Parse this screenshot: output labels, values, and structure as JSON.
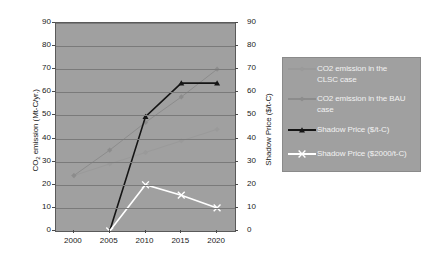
{
  "chart_data": {
    "type": "line",
    "title": "",
    "xlabel": "",
    "ylabel": "CO2 emission (Mt-C/yr.)",
    "ylabel_right": "Shadow Price ($/t-C)",
    "x": [
      2000,
      2005,
      2010,
      2015,
      2020
    ],
    "xticklabels": [
      "2000",
      "2005",
      "2010",
      "2015",
      "2020"
    ],
    "ylim": [
      0,
      90
    ],
    "yticks": [
      0,
      10,
      20,
      30,
      40,
      50,
      60,
      70,
      80,
      90
    ],
    "yticklabels": [
      "0",
      "10",
      "20",
      "30",
      "40",
      "50",
      "60",
      "70",
      "80",
      "90"
    ],
    "ylim_right": [
      0,
      90
    ],
    "yticks_right": [
      0,
      10,
      20,
      30,
      40,
      50,
      60,
      70,
      80,
      90
    ],
    "yticklabels_right": [
      "0",
      "10",
      "20",
      "30",
      "40",
      "50",
      "60",
      "70",
      "80",
      "90"
    ],
    "grid": true,
    "grid_axis": "y",
    "legend_position": "right-outside",
    "plot_background": "#a0a0a0",
    "series": [
      {
        "name": "CO2 emission in the CLSC case",
        "axis": "left",
        "color": "#9a9a9a",
        "marker": "diamond",
        "x": [
          2000,
          2005,
          2010,
          2015,
          2020
        ],
        "values": [
          24,
          29,
          34,
          39,
          44
        ]
      },
      {
        "name": "CO2 emission in the BAU case",
        "axis": "left",
        "color": "#8c8c8c",
        "marker": "diamond",
        "x": [
          2000,
          2005,
          2010,
          2015,
          2020
        ],
        "values": [
          24,
          35,
          47,
          58,
          70
        ]
      },
      {
        "name": "Shadow Price ($/t-C)",
        "axis": "right",
        "color": "#151515",
        "marker": "triangle",
        "x": [
          2005,
          2010,
          2015,
          2020
        ],
        "values": [
          0,
          49.5,
          64,
          64
        ]
      },
      {
        "name": "Shadow Price ($2000/t-C)",
        "axis": "right",
        "color": "#ffffff",
        "marker": "x",
        "x": [
          2005,
          2010,
          2015,
          2020
        ],
        "values": [
          0,
          20,
          15.5,
          10
        ]
      }
    ]
  },
  "legend": {
    "entries": [
      {
        "label_line1": "CO2 emission in the",
        "label_line2": "CLSC case"
      },
      {
        "label_line1": "CO2 emission in the BAU",
        "label_line2": "case"
      },
      {
        "label_line1": "Shadow Price ($/t-C)",
        "label_line2": ""
      },
      {
        "label_line1": "Shadow Price ($2000/t-C)",
        "label_line2": ""
      }
    ]
  },
  "axes": {
    "left_title": "CO2 emission (Mt-C/yr.)",
    "right_title": "Shadow Price ($/t-C)"
  }
}
